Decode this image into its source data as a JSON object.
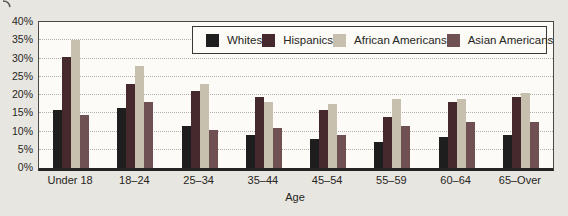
{
  "chart_data": {
    "type": "bar",
    "title": "",
    "categories": [
      "Under 18",
      "18–24",
      "25–34",
      "35–44",
      "45–54",
      "55–59",
      "60–64",
      "65–Over"
    ],
    "series": [
      {
        "name": "Whites",
        "color": "#1f1e1e",
        "values": [
          16,
          16.5,
          11.5,
          9,
          8,
          7,
          8.5,
          9
        ]
      },
      {
        "name": "Hispanics",
        "color": "#45292c",
        "values": [
          30.5,
          23,
          21,
          19.5,
          16,
          14,
          18,
          19.5
        ]
      },
      {
        "name": "African Americans",
        "color": "#c8c0ae",
        "values": [
          35,
          28,
          23,
          18,
          17.5,
          19,
          19,
          20.5
        ]
      },
      {
        "name": "Asian Americans",
        "color": "#705153",
        "values": [
          14.5,
          18,
          10.5,
          11,
          9,
          11.5,
          12.5,
          12.5
        ]
      }
    ],
    "xlabel": "Age",
    "ylabel": "",
    "ylim": [
      0,
      40
    ],
    "ytick_step": 5,
    "ytick_labels": [
      "0%",
      "5%",
      "10%",
      "15%",
      "20%",
      "25%",
      "30%",
      "35%",
      "40%"
    ],
    "grid": true,
    "legend_position": "top-right-inside"
  },
  "colors": {
    "background": "#e8e6e1",
    "plot_background": "#fcfbf7",
    "axis": "#34322f",
    "gridline": "#b3b1aa",
    "text": "#262522"
  }
}
